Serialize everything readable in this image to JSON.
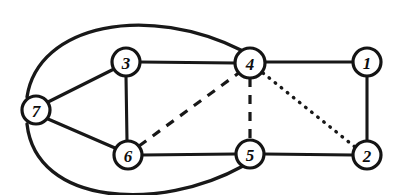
{
  "figure": {
    "width": 405,
    "height": 195,
    "background_color": "#ffffff",
    "ink_color": "#181818"
  },
  "graph": {
    "node_radius": 14,
    "nodes": [
      {
        "id": "1",
        "label": "1",
        "cx": 367,
        "cy": 62,
        "r": 14
      },
      {
        "id": "2",
        "label": "2",
        "cx": 367,
        "cy": 155,
        "r": 14
      },
      {
        "id": "3",
        "label": "3",
        "cx": 126,
        "cy": 62,
        "r": 14
      },
      {
        "id": "4",
        "label": "4",
        "cx": 250,
        "cy": 63,
        "r": 15
      },
      {
        "id": "5",
        "label": "5",
        "cx": 250,
        "cy": 154,
        "r": 14
      },
      {
        "id": "6",
        "label": "6",
        "cx": 128,
        "cy": 155,
        "r": 14
      },
      {
        "id": "7",
        "label": "7",
        "cx": 36,
        "cy": 110,
        "r": 14
      }
    ],
    "edges": [
      {
        "from": "3",
        "to": "4",
        "style": "solid",
        "shape": "line",
        "path": "M 140 62 L 235 63"
      },
      {
        "from": "4",
        "to": "1",
        "style": "solid",
        "shape": "line",
        "path": "M 265 62 L 353 62"
      },
      {
        "from": "1",
        "to": "2",
        "style": "solid",
        "shape": "line",
        "path": "M 367 76 L 367 141"
      },
      {
        "from": "2",
        "to": "5",
        "style": "solid",
        "shape": "line",
        "path": "M 353 155 L 264 154"
      },
      {
        "from": "5",
        "to": "6",
        "style": "solid",
        "shape": "line",
        "path": "M 236 154 L 142 155"
      },
      {
        "from": "6",
        "to": "3",
        "style": "solid",
        "shape": "line",
        "path": "M 127 141 L 126 76"
      },
      {
        "from": "7",
        "to": "3",
        "style": "solid",
        "shape": "line",
        "path": "M 48 102 L 114 69"
      },
      {
        "from": "7",
        "to": "6",
        "style": "solid",
        "shape": "line",
        "path": "M 48 119 L 115 148"
      },
      {
        "from": "7",
        "to": "4",
        "style": "solid",
        "shape": "arc",
        "path": "M 27 97 C 38 24 148 3 243 51"
      },
      {
        "from": "7",
        "to": "5",
        "style": "solid",
        "shape": "arc",
        "path": "M 27 124 C 36 206 160 212 243 166"
      },
      {
        "from": "6",
        "to": "4",
        "style": "dashed",
        "shape": "line",
        "path": "M 139 146 L 240 72"
      },
      {
        "from": "4",
        "to": "5",
        "style": "dashed",
        "shape": "line",
        "path": "M 250 78 L 250 140"
      },
      {
        "from": "4",
        "to": "2",
        "style": "dotted",
        "shape": "line",
        "path": "M 263 73 L 355 147"
      }
    ],
    "edge_style_names": {
      "solid": "solid-edge",
      "dashed": "dashed-edge",
      "dotted": "dotted-edge",
      "arc": "curved-edge"
    }
  }
}
